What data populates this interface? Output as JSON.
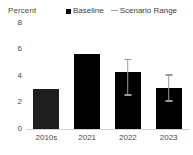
{
  "header": {
    "units_label": "Percent"
  },
  "legend": {
    "position": "top-right",
    "entries": [
      {
        "label": "Baseline",
        "marker": "square-marker-icon",
        "color": "#000000"
      },
      {
        "label": "Scenario Range",
        "marker": "line-marker-icon",
        "color": "#9c9c9c"
      }
    ]
  },
  "chart_data": {
    "type": "bar",
    "title": "",
    "subtitle": "",
    "xlabel": "",
    "ylabel": "Percent",
    "ylim": [
      0,
      8
    ],
    "yticks": [
      "0",
      "2",
      "4",
      "6",
      "8"
    ],
    "ytick_values": [
      0,
      2,
      4,
      6,
      8
    ],
    "grid": false,
    "categories": [
      "2010s",
      "2021",
      "2022",
      "2023"
    ],
    "series": [
      {
        "name": "Baseline",
        "values": [
          3.0,
          5.6,
          4.25,
          3.05
        ]
      }
    ],
    "error_bars": {
      "name": "Scenario Range",
      "low": [
        null,
        null,
        2.55,
        2.1
      ],
      "high": [
        null,
        null,
        5.2,
        4.05
      ]
    },
    "bar_colors": [
      "#1e1e1e",
      "#000000",
      "#000000",
      "#000000"
    ]
  }
}
